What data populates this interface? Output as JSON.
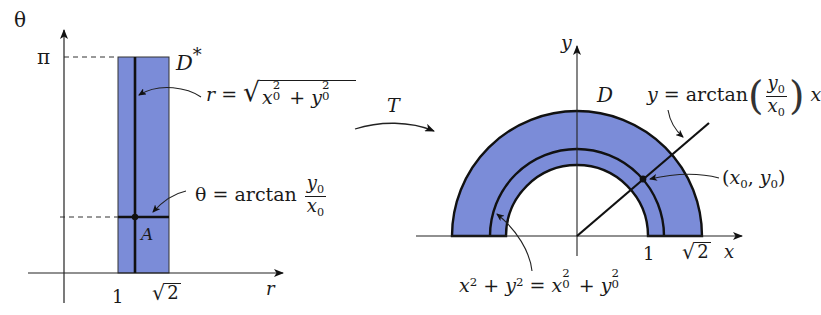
{
  "colors": {
    "region_fill": "#7b8cd8",
    "line": "#111111",
    "axis": "#222222",
    "background": "#ffffff"
  },
  "left_panel": {
    "vertical_axis_label": "θ",
    "horizontal_axis_label": "r",
    "pi_tick_label": "π",
    "tick_1_label": "1",
    "tick_sqrt2_label": "2",
    "region_label": "D",
    "region_label_superscript": "*",
    "point_label": "A",
    "r_equation": {
      "lhs": "r",
      "eq": "=",
      "x": "x",
      "x_sub": "0",
      "x_sup": "2",
      "plus": "+",
      "y": "y",
      "y_sub": "0",
      "y_sup": "2"
    },
    "theta_equation": {
      "lhs": "θ",
      "eq": "=",
      "func": "arctan",
      "numerator": "y",
      "numerator_sub": "0",
      "denominator": "x",
      "denominator_sub": "0"
    }
  },
  "transform": {
    "label": "T"
  },
  "right_panel": {
    "vertical_axis_label": "y",
    "horizontal_axis_label": "x",
    "region_label": "D",
    "tick_1_label": "1",
    "tick_sqrt2_label": "2",
    "line_equation": {
      "lhs": "y",
      "eq": "=",
      "func": "arctan",
      "numerator": "y",
      "numerator_sub": "0",
      "denominator": "x",
      "denominator_sub": "0",
      "trailing": "x"
    },
    "point_label": {
      "open": "(",
      "x": "x",
      "x_sub": "0",
      "comma": ",",
      "y": "y",
      "y_sub": "0",
      "close": ")"
    },
    "circle_equation": {
      "x": "x",
      "x_sup": "2",
      "plus1": "+",
      "y": "y",
      "y_sup": "2",
      "eq": "=",
      "x0": "x",
      "x0_sub": "0",
      "x0_sup": "2",
      "plus2": "+",
      "y0": "y",
      "y0_sub": "0",
      "y0_sup": "2"
    }
  }
}
